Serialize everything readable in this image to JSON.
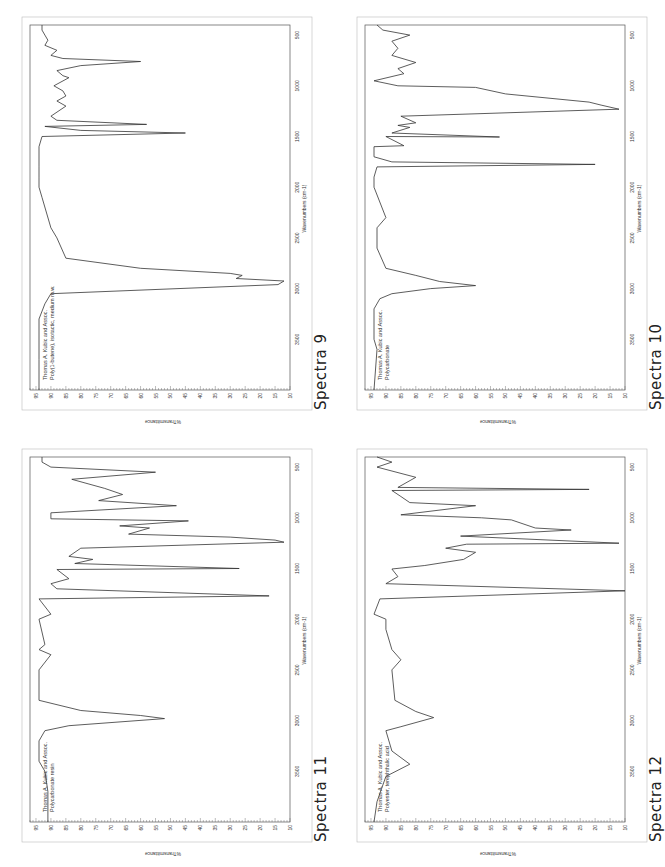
{
  "figure": {
    "panels": [
      {
        "id": "spectra-9",
        "caption": "Spectra 9",
        "credit": "Thomas A. Kubic and Assoc.",
        "sample": "Poly(1-butene), isotactic, medium m.w."
      },
      {
        "id": "spectra-10",
        "caption": "Spectra 10",
        "credit": "Thomas A. Kubic and Assoc.",
        "sample": "Polycarbonate"
      },
      {
        "id": "spectra-11",
        "caption": "Spectra 11",
        "credit": "Thomas A. Kubic and Assoc.",
        "sample": "Polycarbonate resin"
      },
      {
        "id": "spectra-12",
        "caption": "Spectra 12",
        "credit": "Thomas A. Kubic and Assoc.",
        "sample": "Polyester, terephthalic acid"
      }
    ],
    "axes": {
      "xlabel": "Wavenumbers (cm-1)",
      "ylabel": "%Transmittance",
      "xticks": [
        "3500",
        "3000",
        "2500",
        "2000",
        "1500",
        "1000",
        "500"
      ],
      "yticks": [
        "95",
        "90",
        "85",
        "80",
        "75",
        "70",
        "65",
        "60",
        "55",
        "50",
        "45",
        "40",
        "35",
        "30",
        "25",
        "20",
        "15",
        "10"
      ]
    },
    "line_color": "#333333"
  },
  "chart_data": [
    {
      "type": "line",
      "title": "Spectra 9",
      "subtitle": "Thomas A. Kubic and Assoc. — Poly(1-butene), isotactic, medium m.w.",
      "xlabel": "Wavenumbers (cm-1)",
      "ylabel": "%Transmittance",
      "xlim": [
        4000,
        400
      ],
      "ylim": [
        10,
        97
      ],
      "grid": false,
      "orientation": "rotated -90deg on page",
      "x": [
        4000,
        3700,
        3300,
        3150,
        3050,
        2960,
        2925,
        2900,
        2870,
        2850,
        2800,
        2700,
        2500,
        2400,
        2100,
        2000,
        1900,
        1800,
        1600,
        1500,
        1465,
        1440,
        1400,
        1380,
        1340,
        1300,
        1200,
        1150,
        1100,
        1050,
        1000,
        920,
        900,
        850,
        800,
        760,
        730,
        700,
        650,
        600,
        550,
        500,
        450,
        400
      ],
      "y": [
        94,
        94,
        94,
        92,
        90,
        14,
        12,
        28,
        26,
        30,
        60,
        85,
        88,
        90,
        93,
        94,
        94,
        94,
        94,
        93,
        45,
        80,
        92,
        58,
        88,
        90,
        85,
        88,
        85,
        86,
        89,
        84,
        86,
        88,
        80,
        60,
        86,
        90,
        88,
        92,
        91,
        92,
        93,
        93
      ]
    },
    {
      "type": "line",
      "title": "Spectra 10",
      "subtitle": "Thomas A. Kubic and Assoc. — Polycarbonate",
      "xlabel": "Wavenumbers (cm-1)",
      "ylabel": "%Transmittance",
      "xlim": [
        4000,
        400
      ],
      "ylim": [
        10,
        97
      ],
      "grid": false,
      "orientation": "rotated -90deg on page",
      "x": [
        4000,
        3600,
        3500,
        3200,
        3100,
        3050,
        3000,
        2970,
        2930,
        2870,
        2800,
        2600,
        2400,
        2300,
        2000,
        1900,
        1800,
        1775,
        1750,
        1700,
        1600,
        1590,
        1500,
        1505,
        1465,
        1410,
        1390,
        1365,
        1300,
        1230,
        1190,
        1160,
        1080,
        1015,
        1000,
        950,
        880,
        830,
        770,
        700,
        630,
        560,
        500,
        450,
        400
      ],
      "y": [
        94,
        93,
        94,
        94,
        92,
        88,
        75,
        60,
        72,
        80,
        90,
        93,
        93,
        90,
        94,
        94,
        93,
        20,
        88,
        94,
        94,
        84,
        90,
        52,
        88,
        82,
        86,
        80,
        85,
        12,
        18,
        22,
        50,
        60,
        86,
        94,
        84,
        86,
        80,
        88,
        86,
        88,
        82,
        91,
        93
      ]
    },
    {
      "type": "line",
      "title": "Spectra 11",
      "subtitle": "Thomas A. Kubic and Assoc. — Polycarbonate resin",
      "xlabel": "Wavenumbers (cm-1)",
      "ylabel": "%Transmittance",
      "xlim": [
        4000,
        400
      ],
      "ylim": [
        10,
        97
      ],
      "grid": false,
      "orientation": "rotated -90deg on page",
      "x": [
        4000,
        3700,
        3500,
        3400,
        3200,
        3100,
        3050,
        2980,
        2950,
        2900,
        2800,
        2500,
        2350,
        2300,
        2250,
        2000,
        1950,
        1800,
        1770,
        1700,
        1650,
        1600,
        1510,
        1500,
        1450,
        1410,
        1380,
        1300,
        1240,
        1220,
        1190,
        1160,
        1100,
        1080,
        1030,
        1010,
        950,
        880,
        830,
        770,
        710,
        620,
        550,
        500,
        450,
        400
      ],
      "y": [
        91,
        91,
        92,
        94,
        94,
        92,
        84,
        52,
        60,
        80,
        94,
        94,
        90,
        94,
        92,
        94,
        90,
        94,
        17,
        88,
        90,
        84,
        88,
        27,
        82,
        76,
        84,
        80,
        12,
        15,
        30,
        64,
        57,
        67,
        44,
        90,
        90,
        48,
        74,
        66,
        72,
        83,
        55,
        90,
        93,
        93
      ]
    },
    {
      "type": "line",
      "title": "Spectra 12",
      "subtitle": "Thomas A. Kubic and Assoc. — Polyester, terephthalic acid",
      "xlabel": "Wavenumbers (cm-1)",
      "ylabel": "%Transmittance",
      "xlim": [
        4000,
        400
      ],
      "ylim": [
        10,
        97
      ],
      "grid": false,
      "orientation": "rotated -90deg on page",
      "x": [
        4000,
        3800,
        3550,
        3430,
        3300,
        3100,
        3060,
        2970,
        2910,
        2800,
        2500,
        2400,
        2300,
        2100,
        2000,
        1950,
        1800,
        1720,
        1650,
        1580,
        1505,
        1470,
        1410,
        1340,
        1300,
        1260,
        1250,
        1180,
        1120,
        1100,
        1020,
        1000,
        970,
        880,
        850,
        790,
        730,
        720,
        700,
        600,
        500,
        450,
        400
      ],
      "y": [
        94,
        93,
        90,
        82,
        88,
        90,
        85,
        74,
        80,
        87,
        88,
        85,
        88,
        90,
        90,
        94,
        92,
        10,
        90,
        86,
        88,
        77,
        64,
        60,
        70,
        63,
        12,
        65,
        28,
        40,
        48,
        58,
        85,
        60,
        82,
        85,
        88,
        22,
        86,
        80,
        93,
        88,
        93
      ]
    }
  ]
}
